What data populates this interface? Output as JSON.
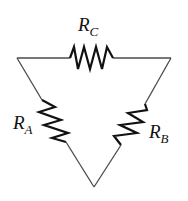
{
  "diagram": {
    "type": "delta-resistor-network",
    "colors": {
      "wire": "#4a4a4a",
      "resistor": "#111111",
      "background": "#ffffff"
    },
    "resistors": [
      {
        "id": "RC",
        "label_main": "R",
        "label_sub": "C",
        "position": "top"
      },
      {
        "id": "RA",
        "label_main": "R",
        "label_sub": "A",
        "position": "left"
      },
      {
        "id": "RB",
        "label_main": "R",
        "label_sub": "B",
        "position": "right"
      }
    ],
    "nodes": [
      "top-left",
      "top-right",
      "bottom"
    ]
  }
}
